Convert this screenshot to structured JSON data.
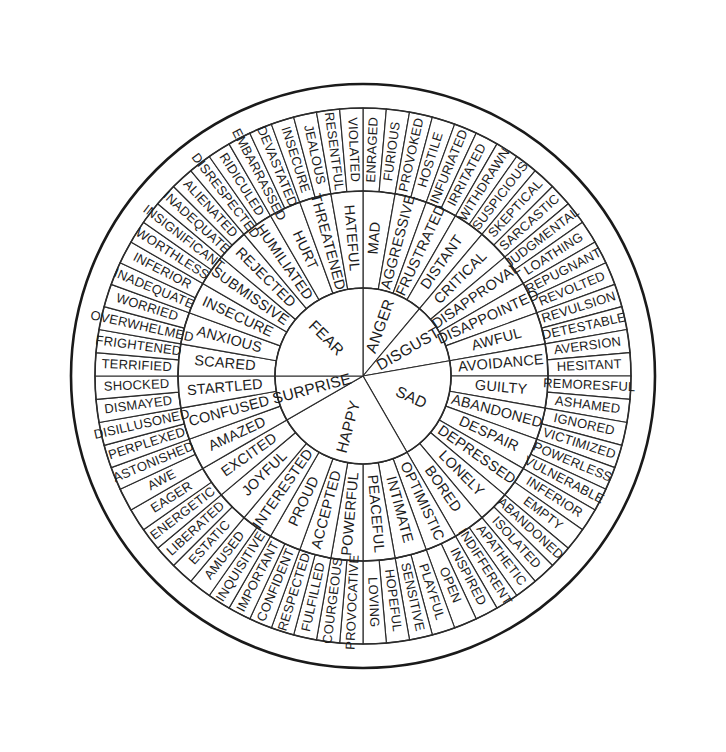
{
  "figure": {
    "name": "emotion-wheel",
    "background_color": "#ffffff",
    "line_color": "#2b2b2b",
    "text_color": "#1c1c1c",
    "center_x": 363,
    "center_y": 376,
    "radii": {
      "core": 88,
      "middle": 185,
      "outer": 268,
      "rim": 292
    },
    "start_angle_deg": -90,
    "ring_counts": {
      "core": 6,
      "middle": 24,
      "outer": 48
    }
  },
  "chart_data": {
    "type": "pie",
    "rings": [
      "core",
      "middle",
      "outer"
    ],
    "core_count": 6,
    "middle_per_core": 4,
    "outer_per_middle": 2,
    "sectors": [
      {
        "core": "ANGER",
        "middle": [
          {
            "label": "MAD",
            "outer": [
              "ENRAGED",
              "FURIOUS"
            ]
          },
          {
            "label": "AGGRESSIVE",
            "outer": [
              "PROVOKED",
              "HOSTILE"
            ]
          },
          {
            "label": "FRUSTRATED",
            "outer": [
              "INFURIATED",
              "IRRITATED"
            ]
          },
          {
            "label": "DISTANT",
            "outer": [
              "WITHDRAWN",
              "SUSPICIOUS"
            ]
          }
        ]
      },
      {
        "core": "DISGUST",
        "middle": [
          {
            "label": "CRITICAL",
            "outer": [
              "SKEPTICAL",
              "SARCASTIC"
            ]
          },
          {
            "label": "DISAPPROVAL",
            "outer": [
              "JUDGMENTAL",
              "LOATHING"
            ]
          },
          {
            "label": "DISAPPOINTED",
            "outer": [
              "REPUGNANT",
              "REVOLTED"
            ]
          },
          {
            "label": "AWFUL",
            "outer": [
              "REVULSION",
              "DETESTABLE"
            ]
          }
        ]
      },
      {
        "core": "SAD",
        "middle": [
          {
            "label": "AVOIDANCE",
            "outer": [
              "AVERSION",
              "HESITANT"
            ]
          },
          {
            "label": "GUILTY",
            "outer": [
              "REMORESFUL",
              "ASHAMED"
            ]
          },
          {
            "label": "ABANDONED",
            "outer": [
              "IGNORED",
              "VICTIMIZED"
            ]
          },
          {
            "label": "DESPAIR",
            "outer": [
              "POWERLESS",
              "VULNERABLE"
            ]
          },
          {
            "label": "DEPRESSED",
            "outer": [
              "INFERIOR",
              "EMPTY"
            ]
          },
          {
            "label": "LONELY",
            "outer": [
              "ABANDONED",
              "ISOLATED"
            ]
          },
          {
            "label": "BORED",
            "outer": [
              "APATHETIC",
              "INDIFFERENT"
            ]
          }
        ]
      },
      {
        "core": "HAPPY",
        "middle": [
          {
            "label": "OPTIMISTIC",
            "outer": [
              "INSPIRED",
              "OPEN"
            ]
          },
          {
            "label": "INTIMATE",
            "outer": [
              "PLAYFUL",
              "SENSITIVE"
            ]
          },
          {
            "label": "PEACEFUL",
            "outer": [
              "HOPEFUL",
              "LOVING"
            ]
          },
          {
            "label": "POWERFUL",
            "outer": [
              "PROVOCATIVE",
              "COURGEOUS"
            ]
          },
          {
            "label": "ACCEPTED",
            "outer": [
              "FULFILLED",
              "RESPECTED"
            ]
          },
          {
            "label": "PROUD",
            "outer": [
              "CONFIDENT",
              "IMPORTANT"
            ]
          },
          {
            "label": "INTERESTED",
            "outer": [
              "INQUISITIVE",
              "AMUSED"
            ]
          },
          {
            "label": "JOYFUL",
            "outer": [
              "ESTATIC",
              "LIBERATED"
            ]
          },
          {
            "label": "EXCITED",
            "outer": [
              "ENERGETIC",
              "EAGER"
            ]
          }
        ]
      },
      {
        "core": "SURPRISE",
        "middle": [
          {
            "label": "AMAZED",
            "outer": [
              "AWE",
              "ASTONISHED"
            ]
          },
          {
            "label": "CONFUSED",
            "outer": [
              "PERPLEXED",
              "DISILLUSONED"
            ]
          },
          {
            "label": "STARTLED",
            "outer": [
              "DISMAYED",
              "SHOCKED"
            ]
          }
        ]
      },
      {
        "core": "FEAR",
        "middle": [
          {
            "label": "SCARED",
            "outer": [
              "TERRIFIED",
              "FRIGHTENED"
            ]
          },
          {
            "label": "ANXIOUS",
            "outer": [
              "OVERWHELMED",
              "WORRIED"
            ]
          },
          {
            "label": "INSECURE",
            "outer": [
              "INADEQUATE",
              "INFERIOR"
            ]
          },
          {
            "label": "SUBMISSIVE",
            "outer": [
              "WORTHLESS",
              "INSIGNIFICANT"
            ]
          },
          {
            "label": "REJECTED",
            "outer": [
              "INADEQUATE",
              "ALIENATED"
            ]
          },
          {
            "label": "HUMILIATED",
            "outer": [
              "DISRESPECTED",
              "RIDICULED"
            ]
          },
          {
            "label": "HURT",
            "outer": [
              "EMBARRASSED",
              "DEVASTATED"
            ]
          },
          {
            "label": "THREATENED",
            "outer": [
              "INSECURE",
              "JEALOUS"
            ]
          },
          {
            "label": "HATEFUL",
            "outer": [
              "RESENTFUL",
              "VIOLATED"
            ]
          }
        ]
      }
    ],
    "core_order_clockwise_from_top": [
      "ANGER",
      "DISGUST",
      "SAD",
      "HAPPY",
      "SURPRISE",
      "FEAR"
    ],
    "middle_order_clockwise_from_top": [
      "MAD",
      "AGGRESSIVE",
      "FRUSTRATED",
      "DISTANT",
      "CRITICAL",
      "DISAPPROVAL",
      "DISAPPOINTED",
      "AWFUL",
      "AVOIDANCE",
      "GUILTY",
      "ABANDONED",
      "DESPAIR",
      "DEPRESSED",
      "LONELY",
      "BORED",
      "OPTIMISTIC",
      "INTIMATE",
      "PEACEFUL",
      "POWERFUL",
      "ACCEPTED",
      "PROUD",
      "INTERESTED",
      "JOYFUL",
      "EXCITED",
      "AMAZED",
      "CONFUSED",
      "STARTLED",
      "SCARED",
      "ANXIOUS",
      "INSECURE",
      "SUBMISSIVE",
      "REJECTED",
      "HUMILIATED",
      "HURT",
      "THREATENED",
      "HATEFUL"
    ],
    "outer_order_clockwise_from_top": [
      "ENRAGED",
      "FURIOUS",
      "PROVOKED",
      "HOSTILE",
      "INFURIATED",
      "IRRITATED",
      "WITHDRAWN",
      "SUSPICIOUS",
      "SKEPTICAL",
      "SARCASTIC",
      "JUDGMENTAL",
      "LOATHING",
      "REPUGNANT",
      "REVOLTED",
      "REVULSION",
      "DETESTABLE",
      "AVERSION",
      "HESITANT",
      "REMORESFUL",
      "ASHAMED",
      "IGNORED",
      "VICTIMIZED",
      "POWERLESS",
      "VULNERABLE",
      "INFERIOR",
      "EMPTY",
      "ABANDONED",
      "ISOLATED",
      "APATHETIC",
      "INDIFFERENT",
      "INSPIRED",
      "OPEN",
      "PLAYFUL",
      "SENSITIVE",
      "HOPEFUL",
      "LOVING",
      "PROVOCATIVE",
      "COURGEOUS",
      "FULFILLED",
      "RESPECTED",
      "CONFIDENT",
      "IMPORTANT",
      "INQUISITIVE",
      "AMUSED",
      "ESTATIC",
      "LIBERATED",
      "ENERGETIC",
      "EAGER",
      "AWE",
      "ASTONISHED",
      "PERPLEXED",
      "DISILLUSONED",
      "DISMAYED",
      "SHOCKED",
      "TERRIFIED",
      "FRIGHTENED",
      "OVERWHELMED",
      "WORRIED",
      "INADEQUATE",
      "INFERIOR",
      "WORTHLESS",
      "INSIGNIFICANT",
      "INADEQUATE",
      "ALIENATED",
      "DISRESPECTED",
      "RIDICULED",
      "EMBARRASSED",
      "DEVASTATED",
      "INSECURE",
      "JEALOUS",
      "RESENTFUL",
      "VIOLATED",
      "FURIOUS",
      "ENRAGED"
    ]
  }
}
